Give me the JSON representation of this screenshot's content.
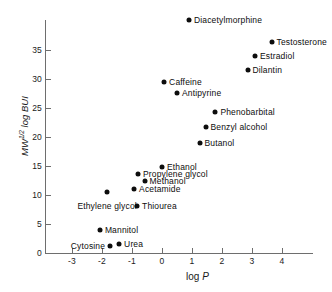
{
  "chart_data": {
    "type": "scatter",
    "title": "",
    "xlabel": "log P",
    "ylabel": "MW^1/2 log BUI",
    "xlim": [
      -3.6,
      4.6
    ],
    "ylim": [
      -1.5,
      41
    ],
    "grid": false,
    "legend": false,
    "xticks": [
      -3,
      -2,
      -1,
      0,
      1,
      2,
      3,
      4
    ],
    "xticklabels": [
      "-3",
      "-2",
      "-1",
      "0",
      "1",
      "2",
      "3",
      "4"
    ],
    "yticks": [
      0,
      5,
      10,
      15,
      20,
      25,
      30,
      35
    ],
    "yticklabels": [
      "0",
      "5",
      "10",
      "15",
      "20",
      "25",
      "30",
      "35"
    ],
    "points": [
      {
        "label": "Diacetylmorphine",
        "x": 0.9,
        "y": 40.2,
        "side": "right"
      },
      {
        "label": "Testosterone",
        "x": 3.65,
        "y": 36.3,
        "side": "right"
      },
      {
        "label": "Estradiol",
        "x": 3.1,
        "y": 34.0,
        "side": "right"
      },
      {
        "label": "Dilantin",
        "x": 2.85,
        "y": 31.6,
        "side": "right"
      },
      {
        "label": "Caffeine",
        "x": 0.07,
        "y": 29.5,
        "side": "right"
      },
      {
        "label": "Antipyrine",
        "x": 0.5,
        "y": 27.6,
        "side": "right"
      },
      {
        "label": "Phenobarbital",
        "x": 1.78,
        "y": 24.3,
        "side": "right"
      },
      {
        "label": "Benzyl alcohol",
        "x": 1.45,
        "y": 21.7,
        "side": "right"
      },
      {
        "label": "Butanol",
        "x": 1.25,
        "y": 19.0,
        "side": "right"
      },
      {
        "label": "Ethanol",
        "x": 0.0,
        "y": 14.9,
        "side": "right"
      },
      {
        "label": "Propylene glycol",
        "x": -0.8,
        "y": 13.7,
        "side": "right"
      },
      {
        "label": "Methanol",
        "x": -0.58,
        "y": 12.4,
        "side": "right"
      },
      {
        "label": "Acetamide",
        "x": -0.93,
        "y": 11.0,
        "side": "right"
      },
      {
        "label": "Ethylene glycol",
        "x": -1.83,
        "y": 10.5,
        "side": "below"
      },
      {
        "label": "Thiourea",
        "x": -0.83,
        "y": 8.1,
        "side": "right"
      },
      {
        "label": "Mannitol",
        "x": -2.07,
        "y": 4.0,
        "side": "right"
      },
      {
        "label": "Urea",
        "x": -1.43,
        "y": 1.55,
        "side": "right"
      },
      {
        "label": "Cytosine",
        "x": -1.73,
        "y": 1.2,
        "side": "left"
      }
    ]
  }
}
